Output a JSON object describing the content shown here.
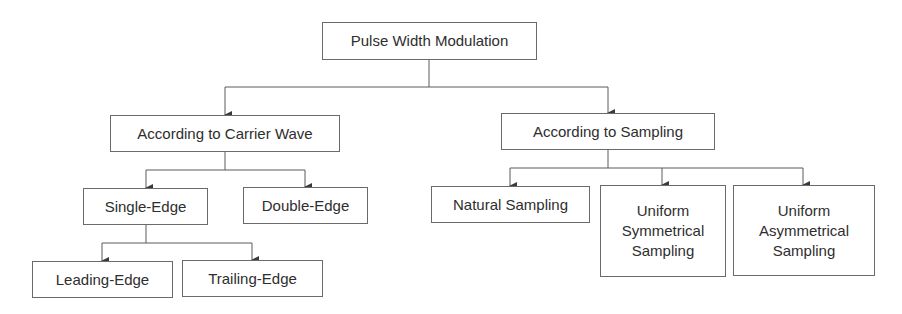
{
  "diagram": {
    "type": "tree",
    "root": {
      "id": "pwm",
      "label": "Pulse Width Modulation"
    },
    "nodes": [
      {
        "id": "pwm",
        "label": "Pulse Width Modulation",
        "parent": null
      },
      {
        "id": "carrier",
        "label": "According to Carrier Wave",
        "parent": "pwm"
      },
      {
        "id": "sampling",
        "label": "According to Sampling",
        "parent": "pwm"
      },
      {
        "id": "single",
        "label": "Single-Edge",
        "parent": "carrier"
      },
      {
        "id": "double",
        "label": "Double-Edge",
        "parent": "carrier"
      },
      {
        "id": "leading",
        "label": "Leading-Edge",
        "parent": "single"
      },
      {
        "id": "trailing",
        "label": "Trailing-Edge",
        "parent": "single"
      },
      {
        "id": "natural",
        "label": "Natural Sampling",
        "parent": "sampling"
      },
      {
        "id": "uniform_sym",
        "label": "Uniform Symmetrical Sampling",
        "parent": "sampling"
      },
      {
        "id": "uniform_asym",
        "label": "Uniform Asymmetrical Sampling",
        "parent": "sampling"
      }
    ]
  },
  "labels": {
    "pwm": "Pulse Width Modulation",
    "carrier": "According to Carrier Wave",
    "sampling": "According to Sampling",
    "single": "Single-Edge",
    "double": "Double-Edge",
    "leading": "Leading-Edge",
    "trailing": "Trailing-Edge",
    "natural": "Natural Sampling",
    "uniform_sym": [
      "Uniform",
      "Symmetrical",
      "Sampling"
    ],
    "uniform_asym": [
      "Uniform",
      "Asymmetrical",
      "Sampling"
    ]
  },
  "colors": {
    "line": "#5a5a5a",
    "border": "#6a6a6a",
    "text": "#2e2e2e",
    "background": "#ffffff"
  }
}
